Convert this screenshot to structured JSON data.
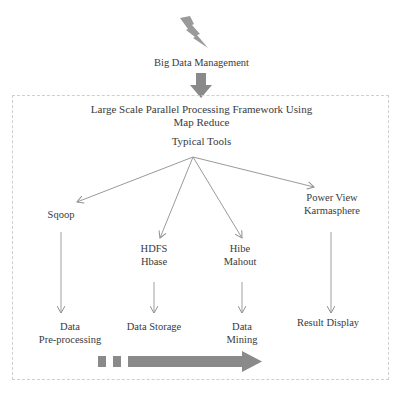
{
  "diagram": {
    "top": {
      "icon": "lightning-icon",
      "title": "Big Data Management",
      "down_arrow_icon": "thick-down-arrow-icon"
    },
    "framework": {
      "title_line1": "Large Scale Parallel Processing Framework Using",
      "title_line2": "Map Reduce",
      "subtitle": "Typical Tools"
    },
    "tools": [
      {
        "line1": "Sqoop",
        "line2": ""
      },
      {
        "line1": "HDFS",
        "line2": "Hbase"
      },
      {
        "line1": "Hibe",
        "line2": "Mahout"
      },
      {
        "line1": "Power View",
        "line2": "Karmasphere"
      }
    ],
    "stages": [
      {
        "line1": "Data",
        "line2": "Pre-processing"
      },
      {
        "line1": "Data Storage",
        "line2": ""
      },
      {
        "line1": "Data",
        "line2": "Mining"
      },
      {
        "line1": "Result Display",
        "line2": ""
      }
    ],
    "progress_arrow_icon": "progress-arrow-icon",
    "colors": {
      "arrow_gray": "#8a8a8a",
      "line_gray": "#9a9a9a",
      "frame_dash": "#cfcfcf",
      "text": "#3a3a3a"
    }
  }
}
